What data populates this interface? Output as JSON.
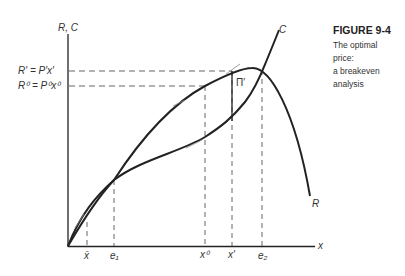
{
  "caption": {
    "title": "FIGURE 9-4",
    "lines": [
      "The optimal",
      "price:",
      "a breakeven",
      "analysis"
    ]
  },
  "axes": {
    "y_label": "R, C",
    "x_label": "x"
  },
  "y_ticks": {
    "r_prime": "R′ = P′x′",
    "r_zero": "R⁰ = P⁰x⁰"
  },
  "x_ticks": {
    "x_bar": "x̄",
    "e1": "e₁",
    "x0": "x⁰",
    "x_prime": "x′",
    "e2": "e₂"
  },
  "curves": {
    "cost": "C",
    "revenue": "R",
    "profit": "Π′"
  },
  "colors": {
    "ink": "#222222",
    "dash": "#555555"
  }
}
